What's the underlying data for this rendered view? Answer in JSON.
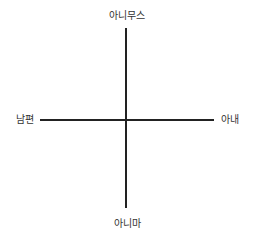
{
  "diagram": {
    "type": "quadrant-axes",
    "axes": {
      "top": "아니무스",
      "bottom": "아니마",
      "left": "남편",
      "right": "아내"
    },
    "line_color": "#222222",
    "text_color": "#333333"
  }
}
